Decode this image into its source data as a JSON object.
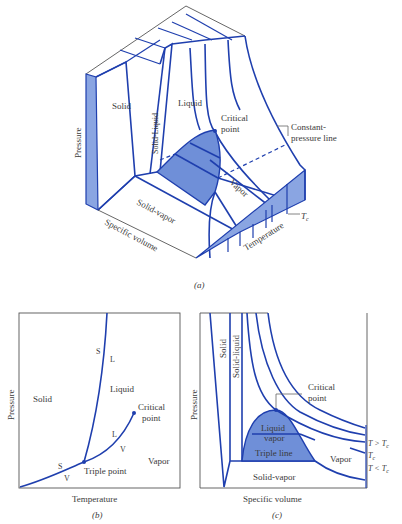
{
  "figure": {
    "panel_a": {
      "caption": "(a)",
      "axes": {
        "pressure": "Pressure",
        "specific_volume": "Specific volume",
        "temperature": "Temperature"
      },
      "regions": {
        "solid": "Solid",
        "solid_liquid": "Solid-Liquid",
        "liquid": "Liquid",
        "vapor": "Vapor",
        "solid_vapor": "Solid-vapor"
      },
      "annotations": {
        "critical_point_1": "Critical",
        "critical_point_2": "point",
        "constant_pressure_1": "Constant-",
        "constant_pressure_2": "pressure line",
        "tc": "T",
        "tc_sub": "c"
      }
    },
    "panel_b": {
      "caption": "(b)",
      "axes": {
        "x": "Temperature",
        "y": "Pressure"
      },
      "regions": {
        "solid": "Solid",
        "liquid": "Liquid",
        "vapor": "Vapor"
      },
      "annotations": {
        "s_top": "S",
        "l_top": "L",
        "l_mid": "L",
        "v_mid": "V",
        "s_low": "S",
        "v_low": "V",
        "critical_point_1": "Critical",
        "critical_point_2": "point",
        "triple_point": "Triple point"
      }
    },
    "panel_c": {
      "caption": "(c)",
      "axes": {
        "x": "Specific volume",
        "y": "Pressure"
      },
      "regions": {
        "solid": "Solid",
        "solid_liquid": "Solid-liquid",
        "liquid_vapor_1": "Liquid",
        "liquid_vapor_2": "vapor",
        "triple_line": "Triple line",
        "vapor": "Vapor",
        "solid_vapor": "Solid-vapor"
      },
      "annotations": {
        "critical_point_1": "Critical",
        "critical_point_2": "point",
        "t_gt": "T > T",
        "t_eq": "T",
        "t_lt": "T < T",
        "sub": "c"
      }
    }
  },
  "colors": {
    "line": "#1f3fae",
    "fill": "#6f8fd8",
    "text": "#3a3a3a"
  }
}
